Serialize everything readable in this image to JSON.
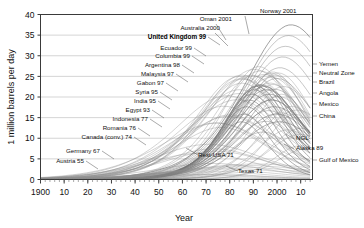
{
  "chart_data": {
    "type": "line",
    "title": "",
    "xlabel": "Year",
    "ylabel": "1 million barrels per day",
    "xlim": [
      1900,
      2015
    ],
    "ylim": [
      0,
      40
    ],
    "xticks": [
      "1900",
      "10",
      "20",
      "30",
      "40",
      "50",
      "60",
      "70",
      "80",
      "90",
      "2000",
      "10"
    ],
    "xtick_values": [
      1900,
      1910,
      1920,
      1930,
      1940,
      1950,
      1960,
      1970,
      1980,
      1990,
      2000,
      2010
    ],
    "yticks": [
      "0",
      "5",
      "10",
      "15",
      "20",
      "25",
      "30",
      "35",
      "40"
    ],
    "ytick_values": [
      0,
      5,
      10,
      15,
      20,
      25,
      30,
      35,
      40
    ],
    "grid": true,
    "legend": "none",
    "series": [
      {
        "name": "Norway 2001",
        "peak_year": 2001,
        "peak_value": 3.4,
        "label_side": "top"
      },
      {
        "name": "Oman 2001",
        "peak_year": 2001,
        "peak_value": 1.0,
        "label_side": "top"
      },
      {
        "name": "Australia 2000",
        "peak_year": 2000,
        "peak_value": 0.8,
        "label_side": "left"
      },
      {
        "name": "United Kingdom 99",
        "peak_year": 1999,
        "peak_value": 2.9,
        "label_side": "left",
        "bold": true
      },
      {
        "name": "Ecuador 99",
        "peak_year": 1999,
        "peak_value": 0.4,
        "label_side": "left"
      },
      {
        "name": "Columbia 99",
        "peak_year": 1999,
        "peak_value": 0.8,
        "label_side": "left"
      },
      {
        "name": "Argentina 98",
        "peak_year": 1998,
        "peak_value": 0.9,
        "label_side": "left"
      },
      {
        "name": "Malaysia 97",
        "peak_year": 1997,
        "peak_value": 0.7,
        "label_side": "left"
      },
      {
        "name": "Gabon 97",
        "peak_year": 1997,
        "peak_value": 0.37,
        "label_side": "left"
      },
      {
        "name": "Syria 95",
        "peak_year": 1995,
        "peak_value": 0.6,
        "label_side": "left"
      },
      {
        "name": "India 95",
        "peak_year": 1995,
        "peak_value": 0.8,
        "label_side": "left"
      },
      {
        "name": "Egypt 93",
        "peak_year": 1993,
        "peak_value": 0.9,
        "label_side": "left"
      },
      {
        "name": "Indonesia 77",
        "peak_year": 1977,
        "peak_value": 1.7,
        "label_side": "left"
      },
      {
        "name": "Romania 76",
        "peak_year": 1976,
        "peak_value": 0.3,
        "label_side": "left"
      },
      {
        "name": "Canada (conv.) 74",
        "peak_year": 1974,
        "peak_value": 1.6,
        "label_side": "left"
      },
      {
        "name": "Germany 67",
        "peak_year": 1967,
        "peak_value": 0.16,
        "label_side": "left"
      },
      {
        "name": "Austria 55",
        "peak_year": 1955,
        "peak_value": 0.07,
        "label_side": "left"
      },
      {
        "name": "Rest-USA 71",
        "peak_year": 1971,
        "peak_value": 5.5,
        "label_side": "inline"
      },
      {
        "name": "Texas 71",
        "peak_year": 1971,
        "peak_value": 3.5,
        "label_side": "inline"
      },
      {
        "name": "NGL",
        "peak_year": 2000,
        "peak_value": 2.0,
        "label_side": "inline"
      },
      {
        "name": "Alaska 89",
        "peak_year": 1989,
        "peak_value": 2.0,
        "label_side": "inline"
      },
      {
        "name": "Yemen",
        "peak_year": 2002,
        "peak_value": 0.45,
        "label_side": "right"
      },
      {
        "name": "Neutral Zone",
        "peak_year": 1997,
        "peak_value": 0.6,
        "label_side": "right"
      },
      {
        "name": "Brazil",
        "peak_year": 2010,
        "peak_value": 2.1,
        "label_side": "right"
      },
      {
        "name": "Angola",
        "peak_year": 2010,
        "peak_value": 1.9,
        "label_side": "right"
      },
      {
        "name": "Mexico",
        "peak_year": 2004,
        "peak_value": 3.4,
        "label_side": "right"
      },
      {
        "name": "China",
        "peak_year": 2010,
        "peak_value": 4.0,
        "label_side": "right"
      },
      {
        "name": "Gulf of Mexico",
        "peak_year": 2003,
        "peak_value": 1.6,
        "label_side": "right"
      }
    ]
  },
  "axes": {
    "ylabel": "1 million barrels per day",
    "xlabel": "Year",
    "yticks": [
      "0",
      "5",
      "10",
      "15",
      "20",
      "25",
      "30",
      "35",
      "40"
    ],
    "xticks": [
      "1900",
      "10",
      "20",
      "30",
      "40",
      "50",
      "60",
      "70",
      "80",
      "90",
      "2000",
      "10"
    ]
  },
  "annotations": {
    "top": [
      {
        "text": "Norway 2001"
      },
      {
        "text": "Oman 2001"
      },
      {
        "text": "Australia 2000"
      }
    ],
    "left": [
      {
        "text": "United Kingdom 99"
      },
      {
        "text": "Ecuador 99"
      },
      {
        "text": "Columbia 99"
      },
      {
        "text": "Argentina 98"
      },
      {
        "text": "Malaysia 97"
      },
      {
        "text": "Gabon 97"
      },
      {
        "text": "Syria 95"
      },
      {
        "text": "India 95"
      },
      {
        "text": "Egypt 93"
      },
      {
        "text": "Indonesia 77"
      },
      {
        "text": "Romania 76"
      },
      {
        "text": "Canada (conv.) 74"
      },
      {
        "text": "Germany 67"
      },
      {
        "text": "Austria 55"
      }
    ],
    "inline": [
      {
        "text": "Rest-USA 71"
      },
      {
        "text": "Texas 71"
      },
      {
        "text": "NGL"
      },
      {
        "text": "Alaska 89"
      }
    ],
    "right": [
      {
        "text": "Yemen"
      },
      {
        "text": "Neutral Zone"
      },
      {
        "text": "Brazil"
      },
      {
        "text": "Angola"
      },
      {
        "text": "Mexico"
      },
      {
        "text": "China"
      },
      {
        "text": "Gulf of Mexico"
      }
    ]
  },
  "colors": {
    "background": "#ffffff",
    "grid": "#b9b9b9",
    "frame": "#3a3a3a",
    "curve": "#8a8a8a",
    "text": "#111111"
  }
}
